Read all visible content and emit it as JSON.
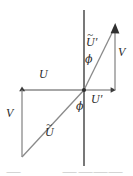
{
  "figure": {
    "background_color": "#ffffff",
    "stroke_color": "#6e6e6e",
    "label_color": "#2b2b2b",
    "axis": {
      "vertical_axis_name": "vertical-axis",
      "vertical_x": 84,
      "vertical_top_y": 10,
      "vertical_bottom_y": 166,
      "origin_x": 84,
      "origin_y": 90
    },
    "labels": {
      "u": "U",
      "u_prime_letter": "U",
      "u_prime_mark": "′",
      "u_tilde_letter": "U",
      "u_tilde_mark": "~",
      "u_tilde_prime_letter": "U",
      "u_tilde_prime_tilde": "~",
      "u_tilde_prime_mark": "′",
      "v_left": "V",
      "v_right": "V",
      "phi_lower": "ϕ",
      "phi_upper": "ϕ"
    },
    "caption_fragments": [
      {
        "text": "⸺",
        "x": 6,
        "y": 2
      },
      {
        "text": "⸺",
        "x": 62,
        "y": 2
      },
      {
        "text": "⸺⸺⸺",
        "x": 78,
        "y": 2
      }
    ]
  },
  "chart_data": {
    "type": "scatter",
    "xlabel": "",
    "ylabel": "",
    "origin": [
      84,
      90
    ],
    "vectors": [
      {
        "name": "U",
        "label": "U",
        "from": [
          84,
          90
        ],
        "to": [
          22,
          90
        ],
        "direction": "left",
        "arrow_at": "to",
        "label_pos": [
          41,
          72
        ]
      },
      {
        "name": "V",
        "label": "V",
        "from": [
          22,
          90
        ],
        "to": [
          22,
          157
        ],
        "direction": "down",
        "arrow_at": "from",
        "label_pos": [
          8,
          113
        ]
      },
      {
        "name": "U-tilde",
        "label": "Ũ",
        "from": [
          22,
          157
        ],
        "to": [
          84,
          90
        ],
        "direction": "up-right",
        "arrow_at": "none",
        "label_pos": [
          47,
          130
        ]
      },
      {
        "name": "U-prime",
        "label": "U′",
        "from": [
          84,
          90
        ],
        "to": [
          115,
          90
        ],
        "direction": "right",
        "arrow_at": "to",
        "label_pos": [
          92,
          96
        ]
      },
      {
        "name": "V-prime",
        "label": "V",
        "from": [
          115,
          90
        ],
        "to": [
          115,
          26
        ],
        "direction": "up",
        "arrow_at": "to",
        "label_pos": [
          119,
          52
        ]
      },
      {
        "name": "U-tilde-prime",
        "label": "Ũ′",
        "from": [
          84,
          90
        ],
        "to": [
          115,
          26
        ],
        "direction": "up-right",
        "arrow_at": "to",
        "label_pos": [
          88,
          40
        ]
      }
    ],
    "angles": [
      {
        "name": "phi-lower",
        "symbol": "ϕ",
        "vertex": [
          84,
          90
        ],
        "between": [
          "vertical-axis-down",
          "U-tilde"
        ],
        "label_pos": [
          78,
          105
        ]
      },
      {
        "name": "phi-upper",
        "symbol": "ϕ",
        "vertex": [
          84,
          90
        ],
        "between": [
          "vertical-axis-up",
          "U-tilde-prime"
        ],
        "label_pos": [
          86,
          58
        ]
      }
    ],
    "grid": false,
    "legend": "none"
  }
}
